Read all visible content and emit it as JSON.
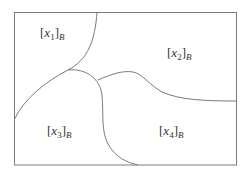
{
  "diagram": {
    "type": "partition-diagram",
    "colors": {
      "stroke": "#7a7a7a",
      "background": "#ffffff",
      "text": "#333333"
    },
    "regions": [
      {
        "id": "x1",
        "var": "x",
        "sub": "1",
        "class_sub": "B"
      },
      {
        "id": "x2",
        "var": "x",
        "sub": "2",
        "class_sub": "B"
      },
      {
        "id": "x3",
        "var": "x",
        "sub": "3",
        "class_sub": "B"
      },
      {
        "id": "x4",
        "var": "x",
        "sub": "4",
        "class_sub": "B"
      }
    ]
  }
}
